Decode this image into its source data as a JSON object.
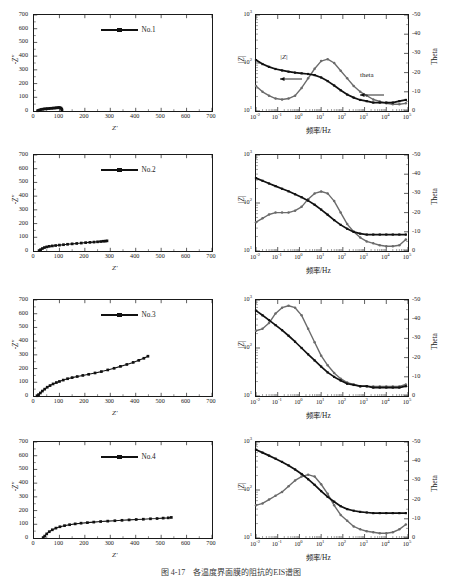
{
  "figure": {
    "caption": "图 4-17　各温度界面膜的阻抗的EIS­­­谱图",
    "rows": 4,
    "columns": 2
  },
  "axes": {
    "nyquist": {
      "xlabel": "Z'",
      "ylabel": "-Z\"",
      "xticks": [
        "0",
        "100",
        "200",
        "300",
        "400",
        "500",
        "600",
        "700"
      ],
      "yticks": [
        "0",
        "100",
        "200",
        "300",
        "400",
        "500",
        "600",
        "700"
      ],
      "xlim": [
        0,
        700
      ],
      "ylim": [
        0,
        700
      ]
    },
    "bode": {
      "xlabel": "频率/Hz",
      "ylabel_left": "|Z|",
      "ylabel_right": "Theta",
      "xticks": [
        "10-2",
        "10-1",
        "100",
        "101",
        "102",
        "103",
        "104",
        "105"
      ],
      "xtick_bases": [
        "10",
        "10",
        "10",
        "10",
        "10",
        "10",
        "10",
        "10"
      ],
      "xtick_exps": [
        "-2",
        "-1",
        "0",
        "1",
        "2",
        "3",
        "4",
        "5"
      ],
      "yticks_left_bases": [
        "10",
        "10",
        "10"
      ],
      "yticks_left_exps": [
        "1",
        "2",
        "3"
      ],
      "yticks_right": [
        "0",
        "-10",
        "-20",
        "-30",
        "-40",
        "-50"
      ],
      "xlim_log": [
        -2,
        5
      ],
      "ylim_left_log": [
        1,
        3
      ],
      "ylim_right": [
        0,
        -50
      ]
    }
  },
  "annotations": {
    "z_modulus": "|Z|",
    "theta": "theta"
  },
  "colors": {
    "impedance_series": "#111111",
    "theta_series": "#6b6b6b",
    "axis": "#1a1a1a"
  },
  "panels": [
    {
      "id": "no1",
      "legend_label": "No.1",
      "nyquist_note": "Very small depressed arc near origin",
      "bode_note": "|Z| plateau ~60 ohm, theta peak ~ -27 deg near 10 Hz"
    },
    {
      "id": "no2",
      "legend_label": "No.2",
      "nyquist_note": "Arc extending to ~290 ohm on Z'",
      "bode_note": "|Z| decays from ~330 to ~22 ohm, theta peak ~ -31 deg near 15 Hz"
    },
    {
      "id": "no3",
      "legend_label": "No.3",
      "nyquist_note": "Arc plus tail extending to ~450 ohm, -Z\" ~290",
      "bode_note": "|Z| decays from ~600 to ~15 ohm, theta peak ~ -47 deg near 0.3 Hz"
    },
    {
      "id": "no4",
      "legend_label": "No.4",
      "nyquist_note": "Arc with tail to ~540 ohm, -Z\" ~150",
      "bode_note": "|Z| decays from ~700 to ~33 ohm, theta peak ~ -33 deg near 3 Hz"
    }
  ],
  "chart_data": [
    {
      "type": "scatter",
      "panel": "no1-nyquist",
      "title": "",
      "xlabel": "Z'",
      "ylabel": "-Z\"",
      "xlim": [
        0,
        700
      ],
      "ylim": [
        0,
        700
      ],
      "grid": false,
      "legend": "No.1",
      "series": [
        {
          "name": "No.1",
          "x": [
            14,
            18,
            23,
            28,
            34,
            40,
            46,
            52,
            58,
            64,
            70,
            76,
            82,
            88,
            93,
            98,
            102,
            106,
            109,
            110
          ],
          "y": [
            2,
            5,
            8,
            11,
            13,
            15,
            16,
            17,
            18,
            19,
            20,
            21,
            22,
            23,
            24,
            25,
            24,
            21,
            14,
            6
          ]
        }
      ]
    },
    {
      "type": "line",
      "panel": "no1-bode",
      "title": "",
      "xlabel": "频率/Hz",
      "ylabel": "|Z|",
      "ylabel_right": "Theta",
      "xlim_log": [
        -2,
        5
      ],
      "ylim_left_log": [
        1,
        3
      ],
      "ylim_right": [
        0,
        -50
      ],
      "grid": false,
      "series": [
        {
          "name": "|Z|",
          "x_log": [
            -2,
            -1.7,
            -1.4,
            -1.1,
            -0.8,
            -0.5,
            -0.2,
            0.1,
            0.4,
            0.7,
            1.0,
            1.3,
            1.6,
            1.9,
            2.2,
            2.5,
            2.8,
            3.1,
            3.4,
            3.7,
            4.0,
            4.3,
            4.6,
            4.9
          ],
          "y": [
            115,
            95,
            83,
            75,
            70,
            66,
            63,
            61,
            59,
            56,
            50,
            42,
            34,
            27,
            22,
            19,
            17,
            16,
            15,
            15,
            15,
            15,
            16,
            17
          ]
        },
        {
          "name": "theta",
          "x_log": [
            -2,
            -1.7,
            -1.4,
            -1.1,
            -0.8,
            -0.5,
            -0.2,
            0.1,
            0.4,
            0.7,
            1.0,
            1.3,
            1.6,
            1.9,
            2.2,
            2.5,
            2.8,
            3.1,
            3.4,
            3.7,
            4.0,
            4.3,
            4.6,
            4.9
          ],
          "y": [
            -13,
            -10,
            -8,
            -6.5,
            -6,
            -6.5,
            -8,
            -12,
            -17,
            -22,
            -26,
            -27,
            -25,
            -21,
            -17,
            -13,
            -10,
            -8,
            -6,
            -5,
            -4,
            -3.5,
            -3.5,
            -4
          ]
        }
      ]
    },
    {
      "type": "scatter",
      "panel": "no2-nyquist",
      "xlabel": "Z'",
      "ylabel": "-Z\"",
      "xlim": [
        0,
        700
      ],
      "ylim": [
        0,
        700
      ],
      "grid": false,
      "legend": "No.2",
      "series": [
        {
          "name": "No.2",
          "x": [
            20,
            26,
            33,
            41,
            50,
            60,
            72,
            85,
            100,
            116,
            132,
            150,
            168,
            186,
            203,
            220,
            236,
            250,
            262,
            272,
            280,
            287
          ],
          "y": [
            3,
            10,
            18,
            25,
            30,
            34,
            37,
            40,
            43,
            46,
            49,
            52,
            55,
            58,
            61,
            63,
            65,
            67,
            69,
            71,
            72,
            74
          ]
        }
      ]
    },
    {
      "type": "line",
      "panel": "no2-bode",
      "xlabel": "频率/Hz",
      "ylabel": "|Z|",
      "ylabel_right": "Theta",
      "xlim_log": [
        -2,
        5
      ],
      "ylim_left_log": [
        1,
        3
      ],
      "ylim_right": [
        0,
        -50
      ],
      "grid": false,
      "series": [
        {
          "name": "|Z|",
          "x_log": [
            -2,
            -1.7,
            -1.4,
            -1.1,
            -0.8,
            -0.5,
            -0.2,
            0.1,
            0.4,
            0.7,
            1.0,
            1.3,
            1.6,
            1.9,
            2.2,
            2.5,
            2.8,
            3.1,
            3.4,
            3.7,
            4.0,
            4.3,
            4.6,
            4.9
          ],
          "y": [
            330,
            290,
            255,
            225,
            198,
            175,
            152,
            132,
            112,
            92,
            73,
            57,
            44,
            35,
            29,
            25,
            23,
            22,
            22,
            22,
            22,
            22,
            22,
            22
          ]
        },
        {
          "name": "theta",
          "x_log": [
            -2,
            -1.7,
            -1.4,
            -1.1,
            -0.8,
            -0.5,
            -0.2,
            0.1,
            0.4,
            0.7,
            1.0,
            1.3,
            1.6,
            1.9,
            2.2,
            2.5,
            2.8,
            3.1,
            3.4,
            3.7,
            4.0,
            4.3,
            4.6,
            4.9
          ],
          "y": [
            -15,
            -17,
            -19,
            -20,
            -20,
            -20,
            -21,
            -23,
            -27,
            -30,
            -31,
            -30,
            -26,
            -20,
            -14,
            -10,
            -7,
            -5,
            -4,
            -3,
            -2.5,
            -2.5,
            -3,
            -6
          ]
        }
      ]
    },
    {
      "type": "scatter",
      "panel": "no3-nyquist",
      "xlabel": "Z'",
      "ylabel": "-Z\"",
      "xlim": [
        0,
        700
      ],
      "ylim": [
        0,
        700
      ],
      "grid": false,
      "legend": "No.3",
      "series": [
        {
          "name": "No.3",
          "x": [
            12,
            18,
            25,
            33,
            42,
            52,
            63,
            75,
            88,
            100,
            115,
            132,
            150,
            170,
            192,
            215,
            240,
            265,
            290,
            315,
            340,
            365,
            390,
            412,
            432,
            448
          ],
          "y": [
            2,
            10,
            22,
            36,
            50,
            64,
            76,
            88,
            98,
            106,
            116,
            126,
            134,
            142,
            150,
            158,
            168,
            178,
            190,
            202,
            216,
            230,
            245,
            260,
            275,
            290
          ]
        }
      ]
    },
    {
      "type": "line",
      "panel": "no3-bode",
      "xlabel": "频率/Hz",
      "ylabel": "|Z|",
      "ylabel_right": "Theta",
      "xlim_log": [
        -2,
        5
      ],
      "ylim_left_log": [
        1,
        3
      ],
      "ylim_right": [
        0,
        -50
      ],
      "grid": false,
      "series": [
        {
          "name": "|Z|",
          "x_log": [
            -2,
            -1.7,
            -1.4,
            -1.1,
            -0.8,
            -0.5,
            -0.2,
            0.1,
            0.4,
            0.7,
            1.0,
            1.3,
            1.6,
            1.9,
            2.2,
            2.5,
            2.8,
            3.1,
            3.4,
            3.7,
            4.0,
            4.3,
            4.6,
            4.9
          ],
          "y": [
            600,
            480,
            380,
            300,
            235,
            180,
            135,
            100,
            74,
            55,
            41,
            31,
            25,
            21,
            18,
            17,
            16,
            16,
            15,
            15,
            15,
            15,
            15,
            16
          ]
        },
        {
          "name": "theta",
          "x_log": [
            -2,
            -1.7,
            -1.4,
            -1.1,
            -0.8,
            -0.5,
            -0.2,
            0.1,
            0.4,
            0.7,
            1.0,
            1.3,
            1.6,
            1.9,
            2.2,
            2.5,
            2.8,
            3.1,
            3.4,
            3.7,
            4.0,
            4.3,
            4.6,
            4.9
          ],
          "y": [
            -34,
            -35,
            -38,
            -43,
            -46,
            -47,
            -46,
            -42,
            -35,
            -28,
            -21,
            -16,
            -12,
            -9,
            -7,
            -6,
            -5,
            -5,
            -5,
            -5,
            -5,
            -5,
            -5,
            -6
          ]
        }
      ]
    },
    {
      "type": "scatter",
      "panel": "no4-nyquist",
      "xlabel": "Z'",
      "ylabel": "-Z\"",
      "xlim": [
        0,
        700
      ],
      "ylim": [
        0,
        700
      ],
      "grid": false,
      "legend": "No.4",
      "series": [
        {
          "name": "No.4",
          "x": [
            36,
            42,
            50,
            60,
            72,
            86,
            102,
            120,
            140,
            162,
            185,
            210,
            235,
            262,
            290,
            318,
            346,
            374,
            402,
            430,
            458,
            484,
            508,
            528,
            540
          ],
          "y": [
            3,
            14,
            30,
            46,
            60,
            72,
            82,
            90,
            97,
            103,
            108,
            112,
            116,
            120,
            123,
            126,
            129,
            132,
            135,
            137,
            140,
            142,
            145,
            147,
            150
          ]
        }
      ]
    },
    {
      "type": "line",
      "panel": "no4-bode",
      "xlabel": "频率/Hz",
      "ylabel": "|Z|",
      "ylabel_right": "Theta",
      "xlim_log": [
        -2,
        5
      ],
      "ylim_left_log": [
        1,
        3
      ],
      "ylim_right": [
        0,
        -50
      ],
      "grid": false,
      "series": [
        {
          "name": "|Z|",
          "x_log": [
            -2,
            -1.7,
            -1.4,
            -1.1,
            -0.8,
            -0.5,
            -0.2,
            0.1,
            0.4,
            0.7,
            1.0,
            1.3,
            1.6,
            1.9,
            2.2,
            2.5,
            2.8,
            3.1,
            3.4,
            3.7,
            4.0,
            4.3,
            4.6,
            4.9
          ],
          "y": [
            690,
            600,
            520,
            450,
            385,
            325,
            268,
            215,
            168,
            128,
            95,
            72,
            57,
            46,
            40,
            37,
            35,
            34,
            33,
            33,
            33,
            33,
            33,
            33
          ]
        },
        {
          "name": "theta",
          "x_log": [
            -2,
            -1.7,
            -1.4,
            -1.1,
            -0.8,
            -0.5,
            -0.2,
            0.1,
            0.4,
            0.7,
            1.0,
            1.3,
            1.6,
            1.9,
            2.2,
            2.5,
            2.8,
            3.1,
            3.4,
            3.7,
            4.0,
            4.3,
            4.6,
            4.9
          ],
          "y": [
            -17,
            -18,
            -20,
            -22,
            -24,
            -27,
            -30,
            -32,
            -33,
            -32,
            -28,
            -23,
            -17,
            -12,
            -9,
            -6,
            -4.5,
            -3.5,
            -3,
            -2.5,
            -2.5,
            -3,
            -4.5,
            -7
          ]
        }
      ]
    }
  ]
}
